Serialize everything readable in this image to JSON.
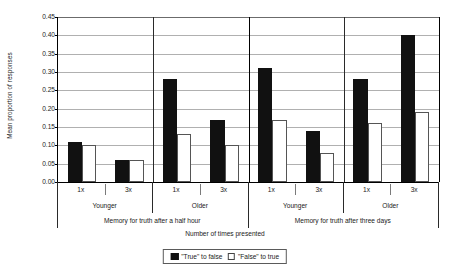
{
  "chart_data": {
    "type": "bar",
    "title": "",
    "xlabel": "Number of times presented",
    "ylabel": "Mean proportion of responses",
    "ylim": [
      0.0,
      0.45
    ],
    "ytick_step": 0.05,
    "yticks": [
      "0.45",
      "0.40",
      "0.35",
      "0.30",
      "0.25",
      "0.20",
      "0.15",
      "0.10",
      "0.05",
      "0.00"
    ],
    "grid": true,
    "legend_position": "bottom",
    "categories": [
      "1x",
      "3x",
      "1x",
      "3x",
      "1x",
      "3x",
      "1x",
      "3x"
    ],
    "group_level_1": [
      {
        "label": "Younger",
        "span": 2
      },
      {
        "label": "Older",
        "span": 2
      },
      {
        "label": "Younger",
        "span": 2
      },
      {
        "label": "Older",
        "span": 2
      }
    ],
    "group_level_2": [
      {
        "label": "Memory for truth after a half hour",
        "span": 4
      },
      {
        "label": "Memory for truth after three days",
        "span": 4
      }
    ],
    "series": [
      {
        "name": "\"True\" to false",
        "color": "#111111",
        "values": [
          0.11,
          0.06,
          0.28,
          0.17,
          0.31,
          0.14,
          0.28,
          0.4
        ]
      },
      {
        "name": "\"False\" to true",
        "color": "#ffffff",
        "values": [
          0.1,
          0.06,
          0.13,
          0.1,
          0.17,
          0.08,
          0.16,
          0.19
        ]
      }
    ]
  },
  "legend": {
    "items": [
      {
        "marker": "filled-square",
        "label": "\"True\" to false"
      },
      {
        "marker": "open-square",
        "label": "\"False\" to true"
      }
    ]
  },
  "colors": {
    "series_true_to_false": "#111111",
    "series_false_to_true": "#ffffff",
    "axis": "#000000",
    "gridline": "#b0b0b0"
  }
}
